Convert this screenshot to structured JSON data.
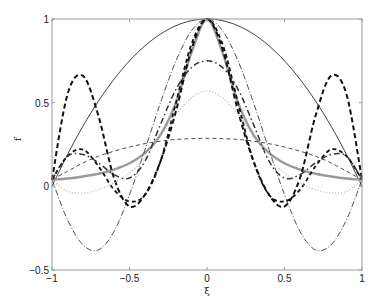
{
  "chart_data": {
    "type": "line",
    "title": "",
    "xlabel": "ξ",
    "ylabel": "f",
    "xlim": [
      -1,
      1
    ],
    "ylim": [
      -0.5,
      1
    ],
    "grid": false,
    "legend": null,
    "xticks": [
      -1,
      -0.5,
      0,
      0.5,
      1
    ],
    "xtick_labels": [
      "−1",
      "−0.5",
      "0",
      "0.5",
      "1"
    ],
    "yticks": [
      -0.5,
      0,
      0.5,
      1
    ],
    "ytick_labels": [
      "−0.5",
      "0",
      "0.5",
      "1"
    ],
    "x": [
      -1,
      -0.9,
      -0.8,
      -0.7,
      -0.6,
      -0.5,
      -0.4,
      -0.3,
      -0.2,
      -0.1,
      0,
      0.1,
      0.2,
      0.3,
      0.4,
      0.5,
      0.6,
      0.7,
      0.8,
      0.9,
      1
    ],
    "series": [
      {
        "name": "thin solid black",
        "style": {
          "color": "#111111",
          "width": 0.8,
          "dash": ""
        },
        "values": [
          0,
          0.19,
          0.36,
          0.51,
          0.64,
          0.75,
          0.84,
          0.91,
          0.96,
          0.99,
          1,
          0.99,
          0.96,
          0.91,
          0.84,
          0.75,
          0.64,
          0.51,
          0.36,
          0.19,
          0
        ]
      },
      {
        "name": "thick gray solid",
        "style": {
          "color": "#999999",
          "width": 2.4,
          "dash": ""
        },
        "values": [
          0.04,
          0.047,
          0.059,
          0.075,
          0.1,
          0.138,
          0.2,
          0.308,
          0.5,
          0.8,
          1,
          0.8,
          0.5,
          0.308,
          0.2,
          0.138,
          0.1,
          0.075,
          0.059,
          0.047,
          0.04
        ]
      },
      {
        "name": "thick dashed (high oscillation)",
        "style": {
          "color": "#111111",
          "width": 2.0,
          "dash": "5,3"
        },
        "values": [
          0.04,
          0.55,
          0.66,
          0.42,
          0.05,
          -0.12,
          -0.05,
          0.15,
          0.45,
          0.82,
          1,
          0.82,
          0.45,
          0.15,
          -0.05,
          -0.12,
          0.05,
          0.42,
          0.66,
          0.55,
          0.04
        ]
      },
      {
        "name": "thick dashed (moderate)",
        "style": {
          "color": "#111111",
          "width": 1.8,
          "dash": "4,3"
        },
        "values": [
          0.04,
          0.18,
          0.22,
          0.12,
          -0.02,
          -0.09,
          -0.05,
          0.15,
          0.5,
          0.85,
          1,
          0.85,
          0.5,
          0.15,
          -0.05,
          -0.09,
          -0.02,
          0.12,
          0.22,
          0.18,
          0.04
        ]
      },
      {
        "name": "thin dash-dot black",
        "style": {
          "color": "#222222",
          "width": 0.8,
          "dash": "6,2,1,2"
        },
        "values": [
          0.04,
          -0.2,
          -0.35,
          -0.38,
          -0.27,
          -0.05,
          0.22,
          0.5,
          0.75,
          0.93,
          1,
          0.93,
          0.75,
          0.5,
          0.22,
          -0.05,
          -0.27,
          -0.38,
          -0.35,
          -0.2,
          0.04
        ]
      },
      {
        "name": "thick dash-dot",
        "style": {
          "color": "#333333",
          "width": 1.5,
          "dash": "6,3,1.5,3"
        },
        "values": [
          0.04,
          0.18,
          0.19,
          0.14,
          0.07,
          0.05,
          0.15,
          0.37,
          0.58,
          0.71,
          0.75,
          0.71,
          0.58,
          0.37,
          0.15,
          0.05,
          0.07,
          0.14,
          0.19,
          0.18,
          0.04
        ]
      },
      {
        "name": "light gray dotted",
        "style": {
          "color": "#bbbbbb",
          "width": 1.3,
          "dash": "1,2"
        },
        "values": [
          0.04,
          -0.03,
          -0.04,
          -0.02,
          0.02,
          0.08,
          0.17,
          0.3,
          0.43,
          0.53,
          0.57,
          0.53,
          0.43,
          0.3,
          0.17,
          0.08,
          0.02,
          -0.02,
          -0.04,
          -0.03,
          0.04
        ]
      },
      {
        "name": "thin dashed black",
        "style": {
          "color": "#222222",
          "width": 0.8,
          "dash": "4,3"
        },
        "values": [
          0.04,
          0.09,
          0.14,
          0.18,
          0.21,
          0.235,
          0.255,
          0.27,
          0.28,
          0.285,
          0.287,
          0.285,
          0.28,
          0.27,
          0.255,
          0.235,
          0.21,
          0.18,
          0.14,
          0.09,
          0.04
        ]
      }
    ]
  },
  "plot_area": {
    "left": 52,
    "right": 362,
    "top": 19,
    "bottom": 270
  }
}
